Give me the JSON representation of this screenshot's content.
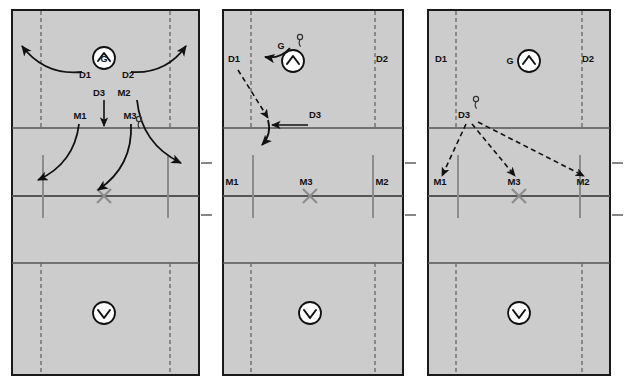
{
  "figure": {
    "kind": "sports-play-diagram",
    "sport": "lacrosse-field-play",
    "panel_count": 3,
    "colors": {
      "field_fill": "#cccccc",
      "field_border": "#1a1a1a",
      "solid_line": "#4d4d4d",
      "dashed_line": "#666666",
      "goal_line_gray": "#8c8c8c",
      "arrow_solid": "#111111",
      "arrow_dashed": "#111111",
      "x_marker": "#8c8c8c",
      "circle_fill": "#ffffff",
      "text": "#111111"
    }
  },
  "panels": [
    {
      "id": "panel-1",
      "name": "phase-1-initial-spread",
      "x": 11,
      "width": 189,
      "goalie": {
        "label": "G",
        "icon": "chevron-up-circle-icon",
        "cx": 104,
        "cy": 58
      },
      "bottom_icon": {
        "label": "",
        "icon": "chevron-down-circle-icon",
        "cx": 104,
        "cy": 313
      },
      "center_marker": {
        "icon": "x-marker",
        "cx": 104,
        "cy": 196
      },
      "players": [
        {
          "label": "D1",
          "x": 85,
          "y": 78
        },
        {
          "label": "D2",
          "x": 128,
          "y": 78
        },
        {
          "label": "D3",
          "x": 99,
          "y": 96
        },
        {
          "label": "M2",
          "x": 124,
          "y": 96
        },
        {
          "label": "M1",
          "x": 80,
          "y": 119
        },
        {
          "label": "M3",
          "x": 130,
          "y": 119
        }
      ],
      "ball": {
        "holder": "M3",
        "x": 139,
        "y": 124
      },
      "arrows": [
        {
          "name": "d1-run-left",
          "style": "solid-curve",
          "from": [
            82,
            72
          ],
          "to": [
            22,
            46
          ]
        },
        {
          "name": "d2-run-right",
          "style": "solid-curve",
          "from": [
            131,
            72
          ],
          "to": [
            186,
            46
          ]
        },
        {
          "name": "d3-run-down",
          "style": "solid-straight",
          "from": [
            104,
            100
          ],
          "to": [
            104,
            126
          ]
        },
        {
          "name": "m1-run-down-left",
          "style": "solid-curve",
          "from": [
            79,
            124
          ],
          "to": [
            38,
            180
          ]
        },
        {
          "name": "m3-run-down-left",
          "style": "solid-curve",
          "from": [
            131,
            124
          ],
          "to": [
            98,
            190
          ]
        },
        {
          "name": "m2-run-down-right",
          "style": "solid-curve",
          "from": [
            137,
            100
          ],
          "to": [
            181,
            163
          ]
        }
      ]
    },
    {
      "id": "panel-2",
      "name": "phase-2-goalie-clears-to-d3",
      "x": 222,
      "width": 182,
      "goalie": {
        "label": "G",
        "icon": "chevron-up-circle-icon",
        "cx": 293,
        "cy": 61
      },
      "bottom_icon": {
        "label": "",
        "icon": "chevron-down-circle-icon",
        "cx": 310,
        "cy": 313
      },
      "center_marker": {
        "icon": "x-marker",
        "cx": 310,
        "cy": 196
      },
      "players": [
        {
          "label": "D1",
          "x": 234,
          "y": 62
        },
        {
          "label": "D2",
          "x": 382,
          "y": 62
        },
        {
          "label": "D3",
          "x": 315,
          "y": 118
        },
        {
          "label": "M1",
          "x": 232,
          "y": 185
        },
        {
          "label": "M3",
          "x": 306,
          "y": 185
        },
        {
          "label": "M2",
          "x": 382,
          "y": 185
        }
      ],
      "ball": {
        "holder": "G",
        "x": 300,
        "y": 42
      },
      "arrows": [
        {
          "name": "g-carry-left",
          "style": "solid-curve",
          "from": [
            290,
            48
          ],
          "to": [
            265,
            57
          ]
        },
        {
          "name": "d1-cut-down",
          "style": "dashed-straight",
          "from": [
            238,
            70
          ],
          "to": [
            268,
            118
          ]
        },
        {
          "name": "d1-continue-down",
          "style": "solid-curve",
          "from": [
            268,
            120
          ],
          "to": [
            262,
            145
          ]
        },
        {
          "name": "pass-to-d3",
          "style": "solid-straight",
          "from": [
            308,
            125
          ],
          "to": [
            272,
            125
          ]
        }
      ]
    },
    {
      "id": "panel-3",
      "name": "phase-3-d3-distributes-to-midfield",
      "x": 427,
      "width": 184,
      "goalie": {
        "label": "G",
        "icon": "chevron-up-circle-icon",
        "cx": 529,
        "cy": 61,
        "label_x": 510,
        "label_y": 64
      },
      "bottom_icon": {
        "label": "",
        "icon": "chevron-down-circle-icon",
        "cx": 519,
        "cy": 313
      },
      "center_marker": {
        "icon": "x-marker",
        "cx": 519,
        "cy": 196
      },
      "players": [
        {
          "label": "D1",
          "x": 441,
          "y": 62
        },
        {
          "label": "D2",
          "x": 588,
          "y": 62
        },
        {
          "label": "D3",
          "x": 464,
          "y": 118
        },
        {
          "label": "M1",
          "x": 440,
          "y": 185
        },
        {
          "label": "M3",
          "x": 514,
          "y": 185
        },
        {
          "label": "M2",
          "x": 583,
          "y": 185
        }
      ],
      "ball": {
        "holder": "D3",
        "x": 476,
        "y": 104
      },
      "arrows": [
        {
          "name": "pass-d3-to-m1",
          "style": "dashed-straight",
          "from": [
            466,
            124
          ],
          "to": [
            442,
            176
          ]
        },
        {
          "name": "pass-d3-to-m3",
          "style": "dashed-straight",
          "from": [
            472,
            124
          ],
          "to": [
            515,
            176
          ]
        },
        {
          "name": "pass-d3-to-m2",
          "style": "dashed-straight",
          "from": [
            478,
            122
          ],
          "to": [
            584,
            176
          ]
        }
      ]
    }
  ],
  "field_geometry": {
    "note": "shared per-panel field markings",
    "horizontal_lines_y": [
      128,
      196,
      263
    ],
    "dashed_vertical_inset_ratio": 0.16,
    "goal_line_top_y": 155,
    "goal_line_bottom_y": 218,
    "edge_ticks_y": [
      163,
      215
    ]
  },
  "legend": {
    "player_codes": [
      "D1",
      "D2",
      "D3",
      "M1",
      "M2",
      "M3",
      "G"
    ],
    "icons": {
      "chevron-up-circle-icon": "attacking direction up",
      "chevron-down-circle-icon": "attacking direction down",
      "x-marker": "center face-off X",
      "ball-marker": "ball possession"
    }
  }
}
